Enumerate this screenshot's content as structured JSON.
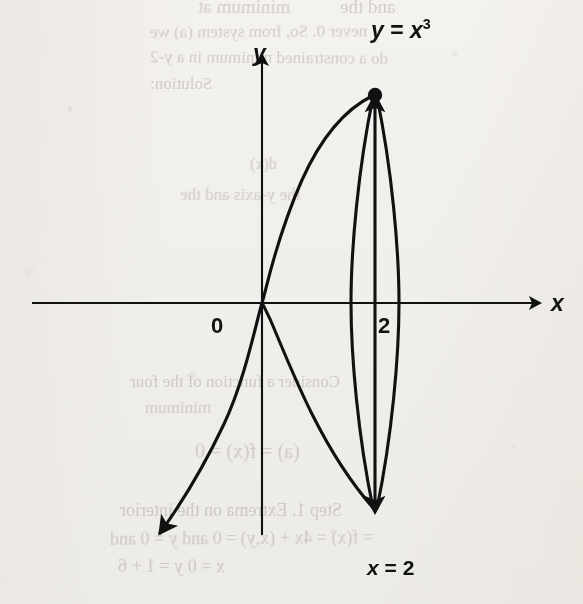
{
  "figure": {
    "kind": "math-graph",
    "background_color": "#f8f7f5",
    "ink_color": "#111111"
  },
  "axes": {
    "x_label": "x",
    "y_label": "y",
    "origin_label": "0",
    "x_tick_label": "2",
    "x_axis_y_px": 303,
    "y_axis_x_px": 262,
    "x_unit_px": 56.5,
    "y_unit_px": 26
  },
  "labels": {
    "curve_equation_var": "y",
    "curve_equation_eq": " = ",
    "curve_equation_base": "x",
    "curve_equation_exponent": "3",
    "curve_equation_full": "y = x3",
    "vertical_line_var": "x",
    "vertical_line_eq": " = ",
    "vertical_line_value": "2",
    "vertical_line_full": "x = 2"
  },
  "ghost_text": [
    {
      "text": "minimum at",
      "x": 198,
      "y": -4,
      "size": 19
    },
    {
      "text": "and the",
      "x": 340,
      "y": -4,
      "size": 19
    },
    {
      "text": "never 0. So, from system (a) we",
      "x": 150,
      "y": 22,
      "size": 17
    },
    {
      "text": "do a constrained minimum in a y-2",
      "x": 150,
      "y": 48,
      "size": 17
    },
    {
      "text": "Solution:",
      "x": 150,
      "y": 74,
      "size": 17
    },
    {
      "text": "d(x)",
      "x": 250,
      "y": 155,
      "size": 16
    },
    {
      "text": "the y-axis and the",
      "x": 180,
      "y": 185,
      "size": 17
    },
    {
      "text": "Consider a function of the four",
      "x": 130,
      "y": 372,
      "size": 17
    },
    {
      "text": "minimum",
      "x": 145,
      "y": 398,
      "size": 17
    },
    {
      "text": "(a) =  f(x) = 0",
      "x": 195,
      "y": 440,
      "size": 20
    },
    {
      "text": "Step 1.  Extrema on the interior",
      "x": 120,
      "y": 500,
      "size": 18
    },
    {
      "text": "=  f(x) = 4x + (x,y) = 0 and y = 0 and",
      "x": 110,
      "y": 528,
      "size": 18
    },
    {
      "text": "x = 0  y = 1 + 6",
      "x": 118,
      "y": 556,
      "size": 18
    }
  ],
  "chart_data": {
    "type": "line",
    "title": "",
    "xlabel": "x",
    "ylabel": "y",
    "grid": false,
    "legend": "none",
    "xlim": [
      -4.05,
      5.5
    ],
    "ylim": [
      -9.9,
      10.0
    ],
    "annotations": [
      {
        "text": "y = x^3",
        "x": 2.0,
        "y": 9.7,
        "role": "curve-equation-label"
      },
      {
        "text": "x = 2",
        "x": 2.0,
        "y": -9.6,
        "role": "vertical-line-label"
      },
      {
        "text": "0",
        "x": -0.8,
        "y": -0.95,
        "role": "origin-label"
      },
      {
        "text": "2",
        "x": 2.12,
        "y": -1.05,
        "role": "x-tick-label"
      },
      {
        "text": "x",
        "x": 5.22,
        "y": 0.0,
        "role": "x-axis-label"
      },
      {
        "text": "y",
        "x": -0.07,
        "y": 9.55,
        "role": "y-axis-label"
      }
    ],
    "points": [
      {
        "x": 2,
        "y": 8,
        "label": "",
        "marker": "filled-dot",
        "note": "intersection of y = x^3 and x = 2"
      }
    ],
    "series": [
      {
        "name": "y = x^3",
        "type": "cubic",
        "x": [
          -2.6,
          -2.4,
          -2.2,
          -2.0,
          -1.8,
          -1.6,
          -1.4,
          -1.2,
          -1.0,
          -0.8,
          -0.6,
          -0.4,
          -0.2,
          0.0,
          0.2,
          0.4,
          0.6,
          0.8,
          1.0,
          1.2,
          1.4,
          1.6,
          1.8,
          2.0
        ],
        "values": [
          -17.58,
          -13.82,
          -10.65,
          -8.0,
          -5.83,
          -4.1,
          -2.74,
          -1.73,
          -1.0,
          -0.51,
          -0.22,
          -0.06,
          -0.01,
          0.0,
          0.01,
          0.06,
          0.22,
          0.51,
          1.0,
          1.73,
          2.74,
          4.1,
          5.83,
          8.0
        ],
        "arrow_at_start": true,
        "arrow_at_end": false
      },
      {
        "name": "x = 2",
        "type": "vertical-line",
        "x": 2,
        "y_from": -9.1,
        "y_to": 9.1,
        "arrow_at_start": true,
        "arrow_at_end": true
      },
      {
        "name": "left-bulge-arc",
        "type": "arc",
        "note": "thin lens arc bulging left, joining (2,8) to (2,-8)",
        "from": [
          2,
          8
        ],
        "to": [
          2,
          -8
        ],
        "extreme_x": 1.6,
        "extreme_y": 0
      },
      {
        "name": "right-bulge-arc",
        "type": "arc",
        "note": "thin lens arc bulging right, joining (2,8) to (2,-8)",
        "from": [
          2,
          8
        ],
        "to": [
          2,
          -8
        ],
        "extreme_x": 2.4,
        "extreme_y": 0
      },
      {
        "name": "reflected-cubic",
        "type": "cubic-reflected",
        "note": "mirror image of y = x^3 across the x-axis, drawn from origin down to (2,-8)",
        "x": [
          0.0,
          0.2,
          0.4,
          0.6,
          0.8,
          1.0,
          1.2,
          1.4,
          1.6,
          1.8,
          2.0
        ],
        "values": [
          0.0,
          -0.01,
          -0.06,
          -0.22,
          -0.51,
          -1.0,
          -1.73,
          -2.74,
          -4.1,
          -5.83,
          -8.0
        ]
      }
    ]
  }
}
